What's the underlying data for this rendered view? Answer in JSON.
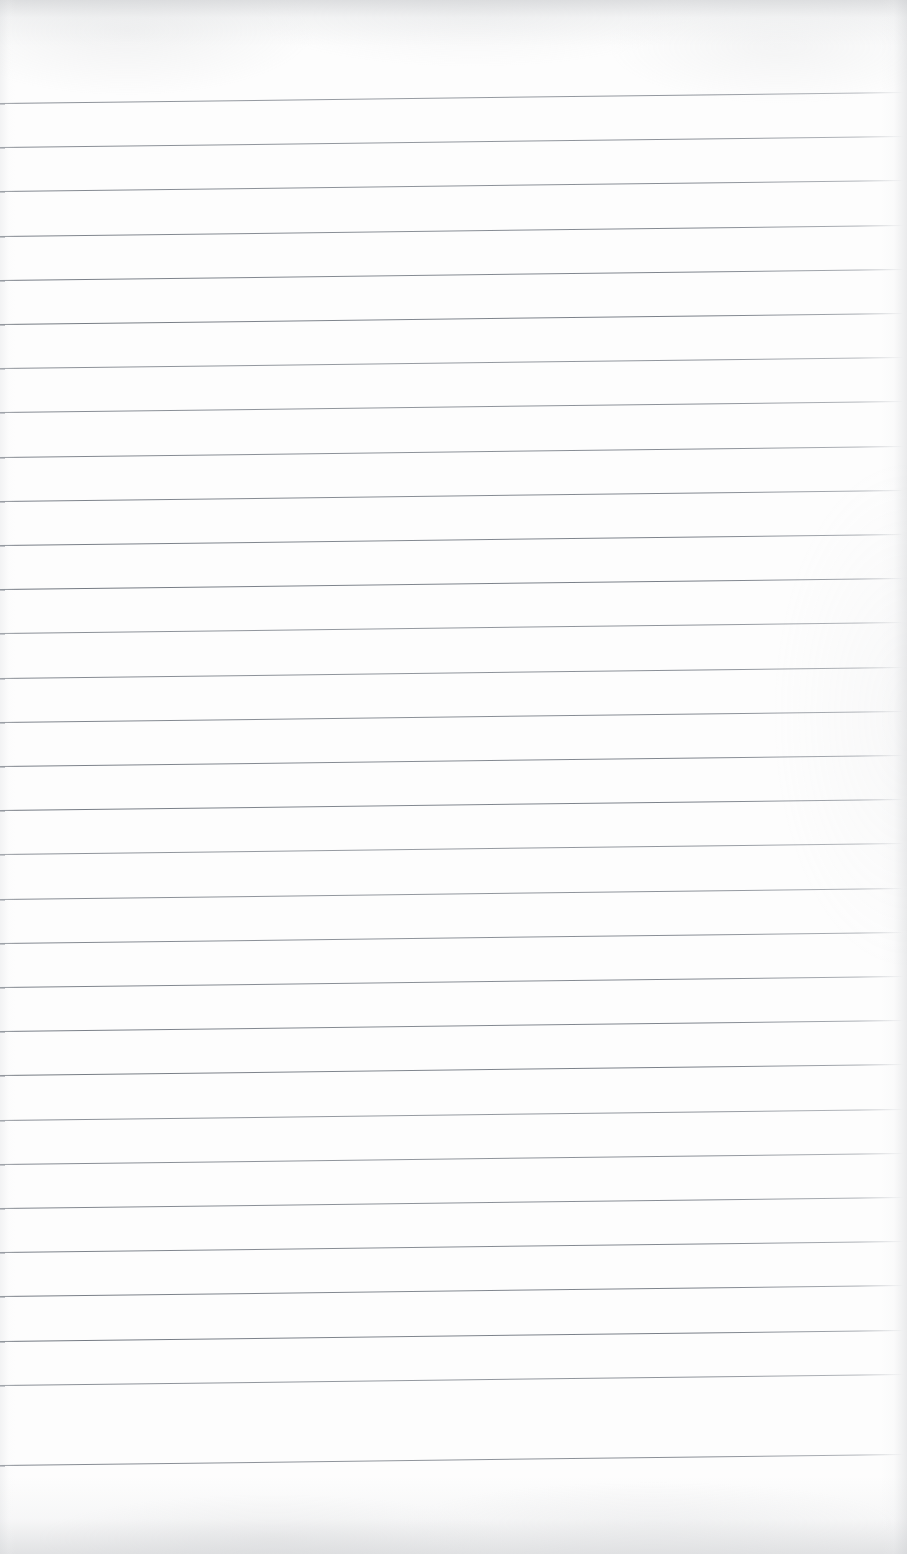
{
  "page": {
    "kind": "scanned-lined-notebook-paper",
    "width": 907,
    "height": 1554,
    "background_color": "#fdfdfd",
    "rule_color": "#787e86",
    "content_text": "",
    "has_written_content": false,
    "has_margin_rule": false,
    "top_margin_px": 103,
    "bottom_margin_px": 89
  },
  "ruling": {
    "line_count": 31,
    "spacing_px": 44.2,
    "first_line_y_left": 103,
    "last_line_y_left": 1465,
    "line_start_x": 0,
    "line_end_x": 903,
    "skew_rise_px": 11,
    "thickness_px": 1
  },
  "chart_data": {
    "type": "line",
    "title": "",
    "xlabel": "",
    "ylabel": "",
    "x": [
      0,
      903
    ],
    "series": [
      {
        "name": "rule-01",
        "values": [
          103,
          92
        ]
      },
      {
        "name": "rule-02",
        "values": [
          147,
          136
        ]
      },
      {
        "name": "rule-03",
        "values": [
          191,
          180
        ]
      },
      {
        "name": "rule-04",
        "values": [
          236,
          225
        ]
      },
      {
        "name": "rule-05",
        "values": [
          280,
          269
        ]
      },
      {
        "name": "rule-06",
        "values": [
          324,
          313
        ]
      },
      {
        "name": "rule-07",
        "values": [
          368,
          357
        ]
      },
      {
        "name": "rule-08",
        "values": [
          412,
          401
        ]
      },
      {
        "name": "rule-09",
        "values": [
          457,
          446
        ]
      },
      {
        "name": "rule-10",
        "values": [
          501,
          490
        ]
      },
      {
        "name": "rule-11",
        "values": [
          545,
          534
        ]
      },
      {
        "name": "rule-12",
        "values": [
          589,
          578
        ]
      },
      {
        "name": "rule-13",
        "values": [
          633,
          622
        ]
      },
      {
        "name": "rule-14",
        "values": [
          678,
          667
        ]
      },
      {
        "name": "rule-15",
        "values": [
          722,
          711
        ]
      },
      {
        "name": "rule-16",
        "values": [
          766,
          755
        ]
      },
      {
        "name": "rule-17",
        "values": [
          810,
          799
        ]
      },
      {
        "name": "rule-18",
        "values": [
          854,
          843
        ]
      },
      {
        "name": "rule-19",
        "values": [
          899,
          888
        ]
      },
      {
        "name": "rule-20",
        "values": [
          943,
          932
        ]
      },
      {
        "name": "rule-21",
        "values": [
          987,
          976
        ]
      },
      {
        "name": "rule-22",
        "values": [
          1031,
          1020
        ]
      },
      {
        "name": "rule-23",
        "values": [
          1075,
          1064
        ]
      },
      {
        "name": "rule-24",
        "values": [
          1120,
          1109
        ]
      },
      {
        "name": "rule-25",
        "values": [
          1164,
          1153
        ]
      },
      {
        "name": "rule-26",
        "values": [
          1208,
          1197
        ]
      },
      {
        "name": "rule-27",
        "values": [
          1252,
          1241
        ]
      },
      {
        "name": "rule-28",
        "values": [
          1296,
          1285
        ]
      },
      {
        "name": "rule-29",
        "values": [
          1341,
          1330
        ]
      },
      {
        "name": "rule-30",
        "values": [
          1385,
          1374
        ]
      },
      {
        "name": "rule-31",
        "values": [
          1465,
          1454
        ]
      }
    ],
    "grid": false,
    "legend": "none"
  }
}
